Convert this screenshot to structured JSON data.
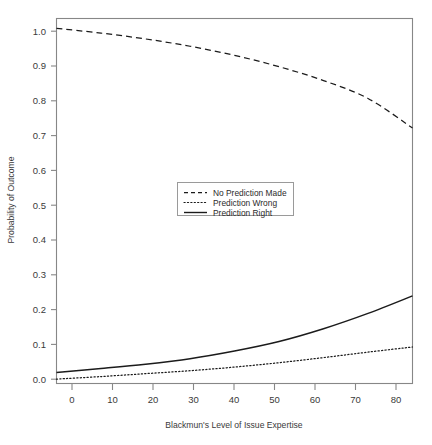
{
  "chart_data": {
    "type": "line",
    "title": "",
    "subtitle": "",
    "xlabel": "Blackmun's Level of Issue Expertise",
    "ylabel": "Probability of Outcome",
    "xlim": [
      0,
      80
    ],
    "ylim": [
      0.0,
      1.0
    ],
    "grid": false,
    "legend_position": "center",
    "xticks": [
      0,
      10,
      20,
      30,
      40,
      50,
      60,
      70,
      80
    ],
    "xtick_labels": [
      "0",
      "10",
      "20",
      "30",
      "40",
      "50",
      "60",
      "70",
      "80"
    ],
    "yticks": [
      0.0,
      0.1,
      0.2,
      0.3,
      0.4,
      0.5,
      0.6,
      0.7,
      0.8,
      0.9,
      1.0
    ],
    "ytick_labels": [
      "0.0",
      "0.1",
      "0.2",
      "0.3",
      "0.4",
      "0.5",
      "0.6",
      "0.7",
      "0.8",
      "0.9",
      "1.0"
    ],
    "x": [
      0,
      10,
      20,
      30,
      40,
      50,
      60,
      70,
      80
    ],
    "series": [
      {
        "name": "No Prediction Made",
        "style": "dashed",
        "color": "#1b1b1b",
        "values": [
          0.973,
          0.96,
          0.944,
          0.924,
          0.899,
          0.868,
          0.83,
          0.781,
          0.7
        ]
      },
      {
        "name": "Prediction Wrong",
        "style": "dotted",
        "color": "#1b1b1b",
        "values": [
          0.012,
          0.019,
          0.027,
          0.035,
          0.045,
          0.057,
          0.071,
          0.086,
          0.1
        ]
      },
      {
        "name": "Prediction Right",
        "style": "solid",
        "color": "#1b1b1b",
        "values": [
          0.03,
          0.041,
          0.053,
          0.068,
          0.089,
          0.115,
          0.15,
          0.192,
          0.24
        ]
      }
    ]
  },
  "axes": {
    "x_title": "Blackmun's Level of Issue Expertise",
    "y_title": "Probability of Outcome",
    "x_tick_labels": [
      "0",
      "10",
      "20",
      "30",
      "40",
      "50",
      "60",
      "70",
      "80"
    ],
    "y_tick_labels": [
      "0.0",
      "0.1",
      "0.2",
      "0.3",
      "0.4",
      "0.5",
      "0.6",
      "0.7",
      "0.8",
      "0.9",
      "1.0"
    ]
  },
  "legend": {
    "entries": [
      {
        "label": "No Prediction Made",
        "style": "dashed"
      },
      {
        "label": "Prediction Wrong",
        "style": "dotted"
      },
      {
        "label": "Prediction Right",
        "style": "solid"
      }
    ]
  },
  "colors": {
    "line": "#1b1b1b",
    "frame": "#878787",
    "text": "#2b2b2b",
    "background": "#ffffff"
  }
}
